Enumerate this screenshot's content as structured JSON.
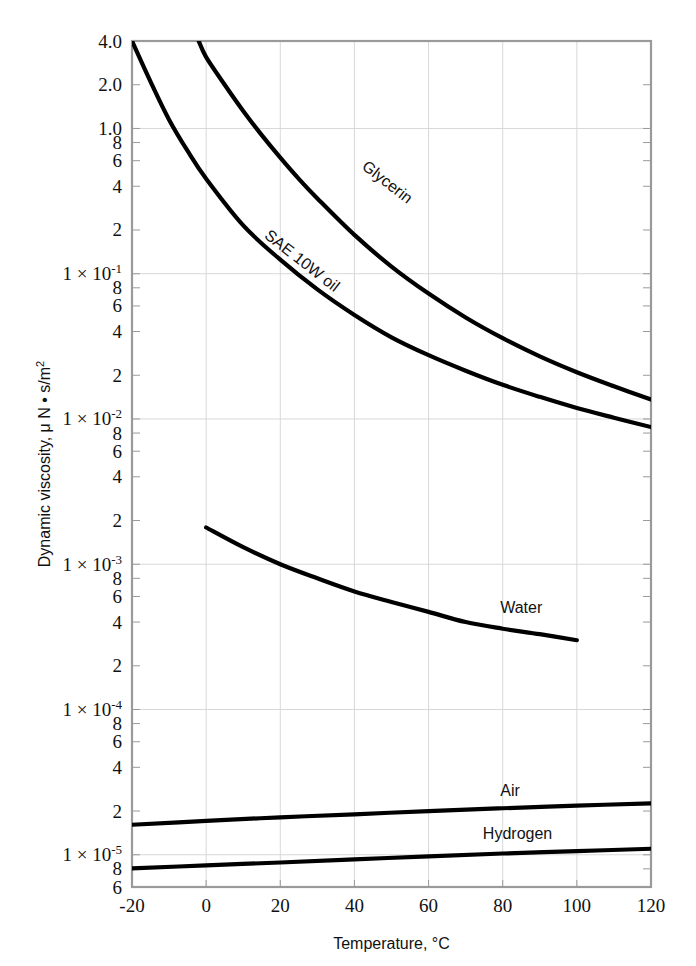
{
  "chart_data": {
    "type": "line",
    "title": "",
    "xlabel": "Temperature, °C",
    "ylabel": "Dynamic viscosity, μ N • s/m²",
    "xlim": [
      -20,
      120
    ],
    "ylim": [
      6e-06,
      4.0
    ],
    "yscale": "log",
    "xscale": "linear",
    "grid": true,
    "legend_position": "inline-curve-labels",
    "xticks": [
      -20,
      0,
      20,
      40,
      60,
      80,
      100,
      120
    ],
    "xticklabels": [
      "-20",
      "0",
      "20",
      "40",
      "60",
      "80",
      "100",
      "120"
    ],
    "ytick_major": [
      {
        "value": 4.0,
        "mantissa": "4.0",
        "exponent": "",
        "prefix": ""
      },
      {
        "value": 2.0,
        "mantissa": "2.0",
        "exponent": "",
        "prefix": ""
      },
      {
        "value": 1.0,
        "mantissa": "1.0",
        "exponent": "",
        "prefix": ""
      },
      {
        "value": 0.8,
        "mantissa": "8",
        "exponent": "",
        "prefix": ""
      },
      {
        "value": 0.6,
        "mantissa": "6",
        "exponent": "",
        "prefix": ""
      },
      {
        "value": 0.4,
        "mantissa": "4",
        "exponent": "",
        "prefix": ""
      },
      {
        "value": 0.2,
        "mantissa": "2",
        "exponent": "",
        "prefix": ""
      },
      {
        "value": 0.1,
        "mantissa": "10",
        "exponent": "-1",
        "prefix": "1 × "
      },
      {
        "value": 0.08,
        "mantissa": "8",
        "exponent": "",
        "prefix": ""
      },
      {
        "value": 0.06,
        "mantissa": "6",
        "exponent": "",
        "prefix": ""
      },
      {
        "value": 0.04,
        "mantissa": "4",
        "exponent": "",
        "prefix": ""
      },
      {
        "value": 0.02,
        "mantissa": "2",
        "exponent": "",
        "prefix": ""
      },
      {
        "value": 0.01,
        "mantissa": "10",
        "exponent": "-2",
        "prefix": "1 × "
      },
      {
        "value": 0.008,
        "mantissa": "8",
        "exponent": "",
        "prefix": ""
      },
      {
        "value": 0.006,
        "mantissa": "6",
        "exponent": "",
        "prefix": ""
      },
      {
        "value": 0.004,
        "mantissa": "4",
        "exponent": "",
        "prefix": ""
      },
      {
        "value": 0.002,
        "mantissa": "2",
        "exponent": "",
        "prefix": ""
      },
      {
        "value": 0.001,
        "mantissa": "10",
        "exponent": "-3",
        "prefix": "1 × "
      },
      {
        "value": 0.0008,
        "mantissa": "8",
        "exponent": "",
        "prefix": ""
      },
      {
        "value": 0.0006,
        "mantissa": "6",
        "exponent": "",
        "prefix": ""
      },
      {
        "value": 0.0004,
        "mantissa": "4",
        "exponent": "",
        "prefix": ""
      },
      {
        "value": 0.0002,
        "mantissa": "2",
        "exponent": "",
        "prefix": ""
      },
      {
        "value": 0.0001,
        "mantissa": "10",
        "exponent": "-4",
        "prefix": "1 × "
      },
      {
        "value": 8e-05,
        "mantissa": "8",
        "exponent": "",
        "prefix": ""
      },
      {
        "value": 6e-05,
        "mantissa": "6",
        "exponent": "",
        "prefix": ""
      },
      {
        "value": 4e-05,
        "mantissa": "4",
        "exponent": "",
        "prefix": ""
      },
      {
        "value": 2e-05,
        "mantissa": "2",
        "exponent": "",
        "prefix": ""
      },
      {
        "value": 1e-05,
        "mantissa": "10",
        "exponent": "-5",
        "prefix": "1 × "
      },
      {
        "value": 8e-06,
        "mantissa": "8",
        "exponent": "",
        "prefix": ""
      },
      {
        "value": 6e-06,
        "mantissa": "6",
        "exponent": "",
        "prefix": ""
      }
    ],
    "gridlines_y": [
      1.0,
      0.1,
      0.01,
      0.001,
      0.0001,
      1e-05
    ],
    "series": [
      {
        "name": "SAE 10W oil",
        "label": "SAE 10W oil",
        "label_rotation": 38,
        "label_x": 25,
        "label_y": 0.115,
        "points": [
          {
            "x": -20,
            "y": 4.0
          },
          {
            "x": -15,
            "y": 2.1
          },
          {
            "x": -10,
            "y": 1.15
          },
          {
            "x": -5,
            "y": 0.7
          },
          {
            "x": 0,
            "y": 0.45
          },
          {
            "x": 10,
            "y": 0.215
          },
          {
            "x": 20,
            "y": 0.125
          },
          {
            "x": 30,
            "y": 0.078
          },
          {
            "x": 40,
            "y": 0.052
          },
          {
            "x": 50,
            "y": 0.0365
          },
          {
            "x": 60,
            "y": 0.0275
          },
          {
            "x": 70,
            "y": 0.0215
          },
          {
            "x": 80,
            "y": 0.0172
          },
          {
            "x": 90,
            "y": 0.0142
          },
          {
            "x": 100,
            "y": 0.0119
          },
          {
            "x": 110,
            "y": 0.0102
          },
          {
            "x": 120,
            "y": 0.0088
          }
        ]
      },
      {
        "name": "Glycerin",
        "label": "Glycerin",
        "label_rotation": 38,
        "label_x": 48,
        "label_y": 0.4,
        "points": [
          {
            "x": -2,
            "y": 4.0
          },
          {
            "x": 0,
            "y": 3.1
          },
          {
            "x": 5,
            "y": 2.0
          },
          {
            "x": 10,
            "y": 1.32
          },
          {
            "x": 15,
            "y": 0.9
          },
          {
            "x": 20,
            "y": 0.63
          },
          {
            "x": 25,
            "y": 0.45
          },
          {
            "x": 30,
            "y": 0.33
          },
          {
            "x": 40,
            "y": 0.185
          },
          {
            "x": 50,
            "y": 0.112
          },
          {
            "x": 60,
            "y": 0.073
          },
          {
            "x": 70,
            "y": 0.05
          },
          {
            "x": 80,
            "y": 0.036
          },
          {
            "x": 90,
            "y": 0.027
          },
          {
            "x": 100,
            "y": 0.021
          },
          {
            "x": 110,
            "y": 0.0168
          },
          {
            "x": 120,
            "y": 0.0136
          }
        ]
      },
      {
        "name": "Water",
        "label": "Water",
        "label_rotation": 0,
        "label_x": 85,
        "label_y": 0.00046,
        "points": [
          {
            "x": 0,
            "y": 0.00179
          },
          {
            "x": 10,
            "y": 0.00131
          },
          {
            "x": 20,
            "y": 0.001
          },
          {
            "x": 30,
            "y": 0.0008
          },
          {
            "x": 40,
            "y": 0.00065
          },
          {
            "x": 50,
            "y": 0.00055
          },
          {
            "x": 60,
            "y": 0.00047
          },
          {
            "x": 70,
            "y": 0.0004
          },
          {
            "x": 80,
            "y": 0.00036
          },
          {
            "x": 90,
            "y": 0.00033
          },
          {
            "x": 100,
            "y": 0.0003
          }
        ]
      },
      {
        "name": "Air",
        "label": "Air",
        "label_rotation": 0,
        "label_x": 82,
        "label_y": 2.55e-05,
        "points": [
          {
            "x": -20,
            "y": 1.61e-05
          },
          {
            "x": 0,
            "y": 1.71e-05
          },
          {
            "x": 20,
            "y": 1.81e-05
          },
          {
            "x": 40,
            "y": 1.9e-05
          },
          {
            "x": 60,
            "y": 2e-05
          },
          {
            "x": 80,
            "y": 2.09e-05
          },
          {
            "x": 100,
            "y": 2.18e-05
          },
          {
            "x": 120,
            "y": 2.26e-05
          }
        ]
      },
      {
        "name": "Hydrogen",
        "label": "Hydrogen",
        "label_rotation": 0,
        "label_x": 84,
        "label_y": 1.28e-05,
        "points": [
          {
            "x": -20,
            "y": 8.05e-06
          },
          {
            "x": 0,
            "y": 8.45e-06
          },
          {
            "x": 20,
            "y": 8.85e-06
          },
          {
            "x": 40,
            "y": 9.3e-06
          },
          {
            "x": 60,
            "y": 9.75e-06
          },
          {
            "x": 80,
            "y": 1.02e-05
          },
          {
            "x": 100,
            "y": 1.06e-05
          },
          {
            "x": 120,
            "y": 1.1e-05
          }
        ]
      }
    ]
  },
  "style": {
    "curve_color": "#000000",
    "grid_color": "#d8d8d8",
    "frame_color": "#9a9a9a",
    "background": "#ffffff",
    "text_color": "#111111"
  },
  "plot_box": {
    "left": 132,
    "right": 651,
    "top": 41,
    "bottom": 887
  }
}
